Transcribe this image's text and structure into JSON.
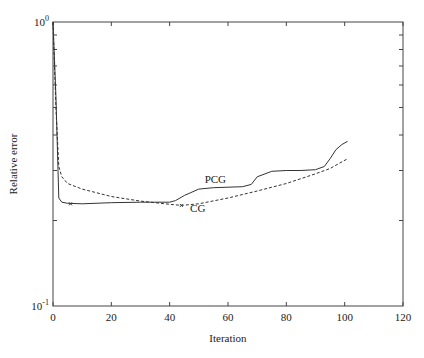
{
  "chart_data": {
    "type": "line",
    "title": "",
    "xlabel": "Iteration",
    "ylabel": "Relative error",
    "xlim": [
      0,
      120
    ],
    "ylim": [
      0.1,
      1.0
    ],
    "yscale": "log",
    "grid": false,
    "x_ticks": [
      "0",
      "20",
      "40",
      "60",
      "80",
      "100",
      "120"
    ],
    "y_ticks": [
      {
        "base": "10",
        "exp": "0"
      },
      {
        "base": "10",
        "exp": "-1"
      }
    ],
    "series": [
      {
        "name": "PCG",
        "style": "solid",
        "x": [
          0,
          1,
          2,
          3,
          5,
          10,
          20,
          30,
          40,
          42,
          45,
          50,
          55,
          60,
          65,
          68,
          70,
          75,
          80,
          85,
          90,
          93,
          95,
          97,
          99,
          101
        ],
        "values": [
          1.0,
          0.55,
          0.24,
          0.232,
          0.23,
          0.229,
          0.231,
          0.232,
          0.232,
          0.235,
          0.245,
          0.258,
          0.261,
          0.262,
          0.263,
          0.268,
          0.285,
          0.298,
          0.3,
          0.3,
          0.302,
          0.31,
          0.33,
          0.355,
          0.37,
          0.38
        ]
      },
      {
        "name": "CG",
        "style": "dashed",
        "x": [
          0,
          1,
          2,
          3,
          5,
          10,
          20,
          30,
          40,
          44,
          50,
          60,
          70,
          80,
          90,
          95,
          101
        ],
        "values": [
          1.0,
          0.5,
          0.31,
          0.285,
          0.27,
          0.258,
          0.243,
          0.234,
          0.228,
          0.226,
          0.229,
          0.24,
          0.254,
          0.27,
          0.292,
          0.305,
          0.33
        ]
      }
    ],
    "annotations": [
      {
        "text": "PCG",
        "x": 52,
        "y": 0.27
      },
      {
        "text": "CG",
        "x": 47,
        "y": 0.215
      }
    ],
    "markers": [
      {
        "series": "PCG",
        "x": 6,
        "y": 0.229
      },
      {
        "series": "CG",
        "x": 44,
        "y": 0.226
      }
    ],
    "legend": "none (inline labels)"
  }
}
